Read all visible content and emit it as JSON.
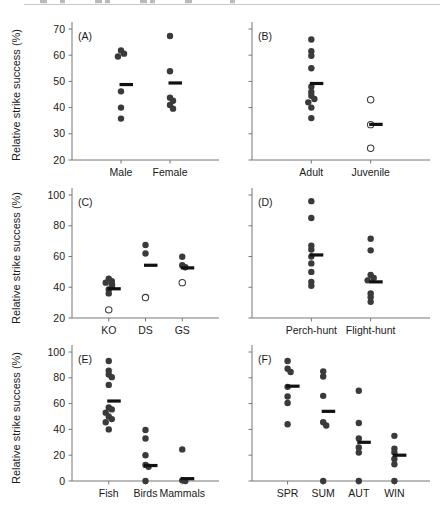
{
  "figure": {
    "axis_title": "Relative strike success (%)",
    "marker_colors": {
      "filled": "#3a3a3a",
      "open_stroke": "#3a3a3a",
      "open_fill": "#ffffff",
      "mean_bar": "#111111",
      "axis": "#777777"
    }
  },
  "chart_data": [
    {
      "type": "scatter",
      "panel": "(A)",
      "title": "",
      "xlabel": "",
      "ylabel": "Relative strike success (%)",
      "ylim": [
        20,
        70
      ],
      "yticks": [
        20,
        30,
        40,
        50,
        60,
        70
      ],
      "ytick_labels": [
        "20",
        "30",
        "40",
        "50",
        "60",
        "70"
      ],
      "grid": false,
      "legend": "none",
      "categories": [
        "Male",
        "Female"
      ],
      "groups": [
        {
          "name": "Male",
          "marker": "filled",
          "values": [
            61.8,
            60.6,
            59.5,
            46.2,
            40.0,
            35.8
          ],
          "mean": 48.8
        },
        {
          "name": "Female",
          "marker": "filled",
          "values": [
            67.3,
            53.9,
            43.8,
            42.6,
            41.0,
            39.6
          ],
          "mean": 49.4
        }
      ]
    },
    {
      "type": "scatter",
      "panel": "(B)",
      "title": "",
      "xlabel": "",
      "ylabel": "",
      "ylim": [
        20,
        70
      ],
      "yticks": [
        20,
        30,
        40,
        50,
        60,
        70
      ],
      "ytick_labels": [
        "",
        "",
        "",
        "",
        "",
        ""
      ],
      "grid": false,
      "legend": "none",
      "categories": [
        "Adult",
        "Juvenile"
      ],
      "groups": [
        {
          "name": "Adult",
          "marker": "filled",
          "values": [
            66.0,
            61.5,
            59.8,
            55.0,
            48.0,
            46.0,
            44.5,
            43.3,
            42.0,
            40.0,
            36.0
          ],
          "mean": 49.2
        },
        {
          "name": "Juvenile",
          "marker": "open",
          "values": [
            43.0,
            33.5,
            24.5
          ],
          "mean": 33.6
        }
      ]
    },
    {
      "type": "scatter",
      "panel": "(C)",
      "title": "",
      "xlabel": "",
      "ylabel": "Relative strike success (%)",
      "ylim": [
        20,
        100
      ],
      "yticks": [
        20,
        40,
        60,
        80,
        100
      ],
      "ytick_labels": [
        "20",
        "40",
        "60",
        "80",
        "100"
      ],
      "grid": false,
      "legend": "none",
      "categories": [
        "KO",
        "DS",
        "GS"
      ],
      "groups": [
        {
          "name": "KO",
          "marker": "filled",
          "values": [
            45.5,
            44.0,
            43.0,
            42.0,
            41.0,
            38.5,
            36.0
          ],
          "mean": 39.0
        },
        {
          "name": "KO-open",
          "marker": "open",
          "values": [
            25.3
          ],
          "mean": null
        },
        {
          "name": "DS",
          "marker": "filled",
          "values": [
            67.5,
            62.0
          ],
          "mean": 54.3
        },
        {
          "name": "DS-open",
          "marker": "open",
          "values": [
            33.3
          ],
          "mean": null
        },
        {
          "name": "GS",
          "marker": "filled",
          "values": [
            59.8,
            54.3,
            53.0
          ],
          "mean": 52.6
        },
        {
          "name": "GS-open",
          "marker": "open",
          "values": [
            43.0
          ],
          "mean": null
        }
      ]
    },
    {
      "type": "scatter",
      "panel": "(D)",
      "title": "",
      "xlabel": "",
      "ylabel": "",
      "ylim": [
        20,
        100
      ],
      "yticks": [
        20,
        40,
        60,
        80,
        100
      ],
      "ytick_labels": [
        "",
        "",
        "",
        "",
        ""
      ],
      "grid": false,
      "legend": "none",
      "categories": [
        "Perch-hunt",
        "Flight-hunt"
      ],
      "groups": [
        {
          "name": "Perch-hunt",
          "marker": "filled",
          "values": [
            96.0,
            85.0,
            67.0,
            64.5,
            60.0,
            55.5,
            50.0,
            43.5,
            41.0
          ],
          "mean": 61.0
        },
        {
          "name": "Flight-hunt",
          "marker": "filled",
          "values": [
            71.5,
            64.0,
            48.0,
            46.0,
            44.5,
            36.0,
            33.5,
            30.5
          ],
          "mean": 43.5
        }
      ]
    },
    {
      "type": "scatter",
      "panel": "(E)",
      "title": "",
      "xlabel": "",
      "ylabel": "Relative strike success (%)",
      "ylim": [
        0,
        100
      ],
      "yticks": [
        0,
        20,
        40,
        60,
        80,
        100
      ],
      "ytick_labels": [
        "0",
        "20",
        "40",
        "60",
        "80",
        "100"
      ],
      "grid": false,
      "legend": "none",
      "categories": [
        "Fish",
        "Birds",
        "Mammals"
      ],
      "groups": [
        {
          "name": "Fish",
          "marker": "filled",
          "values": [
            93.0,
            85.5,
            82.5,
            80.5,
            74.5,
            57.0,
            55.5,
            53.0,
            50.0,
            48.0,
            45.5,
            40.0
          ],
          "mean": 62.0
        },
        {
          "name": "Birds",
          "marker": "filled",
          "values": [
            39.5,
            33.0,
            20.0,
            12.5,
            11.0,
            0.0
          ],
          "mean": 12.0
        },
        {
          "name": "Mammals",
          "marker": "filled",
          "values": [
            24.5,
            0.5,
            0.0
          ],
          "mean": 1.8
        }
      ]
    },
    {
      "type": "scatter",
      "panel": "(F)",
      "title": "",
      "xlabel": "",
      "ylabel": "",
      "ylim": [
        0,
        100
      ],
      "yticks": [
        0,
        20,
        40,
        60,
        80,
        100
      ],
      "ytick_labels": [
        "",
        "",
        "",
        "",
        "",
        ""
      ],
      "grid": false,
      "legend": "none",
      "categories": [
        "SPR",
        "SUM",
        "AUT",
        "WIN"
      ],
      "groups": [
        {
          "name": "SPR",
          "marker": "filled",
          "values": [
            93.0,
            87.0,
            84.5,
            73.0,
            65.5,
            60.5,
            44.0
          ],
          "mean": 73.5
        },
        {
          "name": "SUM",
          "marker": "filled",
          "values": [
            85.0,
            81.0,
            66.0,
            45.5,
            43.0,
            0.0
          ],
          "mean": 54.0
        },
        {
          "name": "AUT",
          "marker": "filled",
          "values": [
            70.0,
            45.0,
            33.0,
            26.0,
            22.0,
            0.0
          ],
          "mean": 30.0
        },
        {
          "name": "WIN",
          "marker": "filled",
          "values": [
            35.0,
            25.0,
            22.0,
            17.0,
            13.0,
            0.0
          ],
          "mean": 20.0
        }
      ]
    }
  ]
}
